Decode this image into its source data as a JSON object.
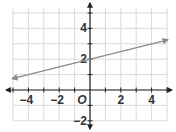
{
  "chart_data": {
    "type": "line",
    "title": "",
    "xlabel": "",
    "ylabel": "",
    "xlim": [
      -5,
      5
    ],
    "ylim": [
      -2,
      5
    ],
    "grid": true,
    "x_ticks": [
      -4,
      -2,
      2,
      4
    ],
    "y_ticks": [
      -2,
      2,
      4
    ],
    "x_tick_labels": [
      "−4",
      "−2",
      "2",
      "4"
    ],
    "y_tick_labels": [
      "−2",
      "2",
      "4"
    ],
    "origin_label": "O",
    "series": [
      {
        "name": "line",
        "equation": "y = 0.25x + 2",
        "slope": 0.25,
        "intercept": 2,
        "x": [
          -5,
          5
        ],
        "y": [
          0.75,
          3.25
        ],
        "arrows_both_ends": true,
        "color": "#8a8a8a"
      }
    ]
  },
  "colors": {
    "grid": "#d9d9d9",
    "axis": "#222222",
    "line": "#8a8a8a",
    "background": "#ffffff"
  }
}
